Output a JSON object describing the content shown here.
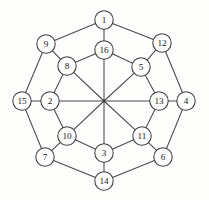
{
  "figure": {
    "kind": "graph-diagram",
    "title": "",
    "colors": {
      "background": "#fdfdfc",
      "edge": "#4a4a4a",
      "node_stroke": "#3d3d3d",
      "node_fill": "#fdfdfc",
      "label": "#1a1a1a"
    },
    "geometry": {
      "width": 209,
      "height": 200,
      "center_x": 104,
      "center_y": 101,
      "node_radius": 9.2
    }
  },
  "nodes": [
    {
      "id": "n1",
      "label": "1",
      "ring": "outer",
      "x": 104,
      "y": 20
    },
    {
      "id": "n12",
      "label": "12",
      "ring": "outer",
      "x": 162,
      "y": 43
    },
    {
      "id": "n4",
      "label": "4",
      "ring": "outer",
      "x": 186,
      "y": 101
    },
    {
      "id": "n6",
      "label": "6",
      "ring": "outer",
      "x": 163,
      "y": 157
    },
    {
      "id": "n14",
      "label": "14",
      "ring": "outer",
      "x": 104,
      "y": 181
    },
    {
      "id": "n7",
      "label": "7",
      "ring": "outer",
      "x": 45,
      "y": 157
    },
    {
      "id": "n15",
      "label": "15",
      "ring": "outer",
      "x": 22,
      "y": 101
    },
    {
      "id": "n9",
      "label": "9",
      "ring": "outer",
      "x": 46,
      "y": 44
    },
    {
      "id": "n16",
      "label": "16",
      "ring": "inner",
      "x": 104,
      "y": 50
    },
    {
      "id": "n5",
      "label": "5",
      "ring": "inner",
      "x": 141,
      "y": 67
    },
    {
      "id": "n13",
      "label": "13",
      "ring": "inner",
      "x": 159,
      "y": 101
    },
    {
      "id": "n11",
      "label": "11",
      "ring": "inner",
      "x": 142,
      "y": 136
    },
    {
      "id": "n3",
      "label": "3",
      "ring": "inner",
      "x": 104,
      "y": 153
    },
    {
      "id": "n10",
      "label": "10",
      "ring": "inner",
      "x": 67,
      "y": 136
    },
    {
      "id": "n2",
      "label": "2",
      "ring": "inner",
      "x": 50,
      "y": 101
    },
    {
      "id": "n8",
      "label": "8",
      "ring": "inner",
      "x": 67,
      "y": 66
    }
  ],
  "hub": {
    "id": "hub",
    "label": "",
    "x": 104,
    "y": 101
  },
  "edges": [
    {
      "from": "n1",
      "to": "n12",
      "kind": "outer-ring"
    },
    {
      "from": "n12",
      "to": "n4",
      "kind": "outer-ring"
    },
    {
      "from": "n4",
      "to": "n6",
      "kind": "outer-ring"
    },
    {
      "from": "n6",
      "to": "n14",
      "kind": "outer-ring"
    },
    {
      "from": "n14",
      "to": "n7",
      "kind": "outer-ring"
    },
    {
      "from": "n7",
      "to": "n15",
      "kind": "outer-ring"
    },
    {
      "from": "n15",
      "to": "n9",
      "kind": "outer-ring"
    },
    {
      "from": "n9",
      "to": "n1",
      "kind": "outer-ring"
    },
    {
      "from": "n16",
      "to": "n5",
      "kind": "inner-ring"
    },
    {
      "from": "n5",
      "to": "n13",
      "kind": "inner-ring"
    },
    {
      "from": "n13",
      "to": "n11",
      "kind": "inner-ring"
    },
    {
      "from": "n11",
      "to": "n3",
      "kind": "inner-ring"
    },
    {
      "from": "n3",
      "to": "n10",
      "kind": "inner-ring"
    },
    {
      "from": "n10",
      "to": "n2",
      "kind": "inner-ring"
    },
    {
      "from": "n2",
      "to": "n8",
      "kind": "inner-ring"
    },
    {
      "from": "n8",
      "to": "n16",
      "kind": "inner-ring"
    },
    {
      "from": "n1",
      "to": "n16",
      "kind": "radial"
    },
    {
      "from": "n12",
      "to": "n5",
      "kind": "radial"
    },
    {
      "from": "n4",
      "to": "n13",
      "kind": "radial"
    },
    {
      "from": "n6",
      "to": "n11",
      "kind": "radial"
    },
    {
      "from": "n14",
      "to": "n3",
      "kind": "radial"
    },
    {
      "from": "n7",
      "to": "n10",
      "kind": "radial"
    },
    {
      "from": "n15",
      "to": "n2",
      "kind": "radial"
    },
    {
      "from": "n9",
      "to": "n8",
      "kind": "radial"
    }
  ],
  "spokes": [
    {
      "from": "hub",
      "to": "n16"
    },
    {
      "from": "hub",
      "to": "n5"
    },
    {
      "from": "hub",
      "to": "n13"
    },
    {
      "from": "hub",
      "to": "n11"
    },
    {
      "from": "hub",
      "to": "n3"
    },
    {
      "from": "hub",
      "to": "n10"
    },
    {
      "from": "hub",
      "to": "n2"
    },
    {
      "from": "hub",
      "to": "n8"
    }
  ]
}
